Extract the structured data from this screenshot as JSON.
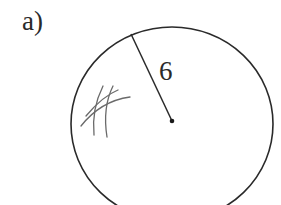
{
  "figure": {
    "part_label": "a)",
    "radius_label": "6",
    "shape": "circle",
    "radius_value": 6,
    "colors": {
      "stroke": "#2a2a2a",
      "scribble": "#6a6a6a",
      "background": "#ffffff"
    }
  }
}
